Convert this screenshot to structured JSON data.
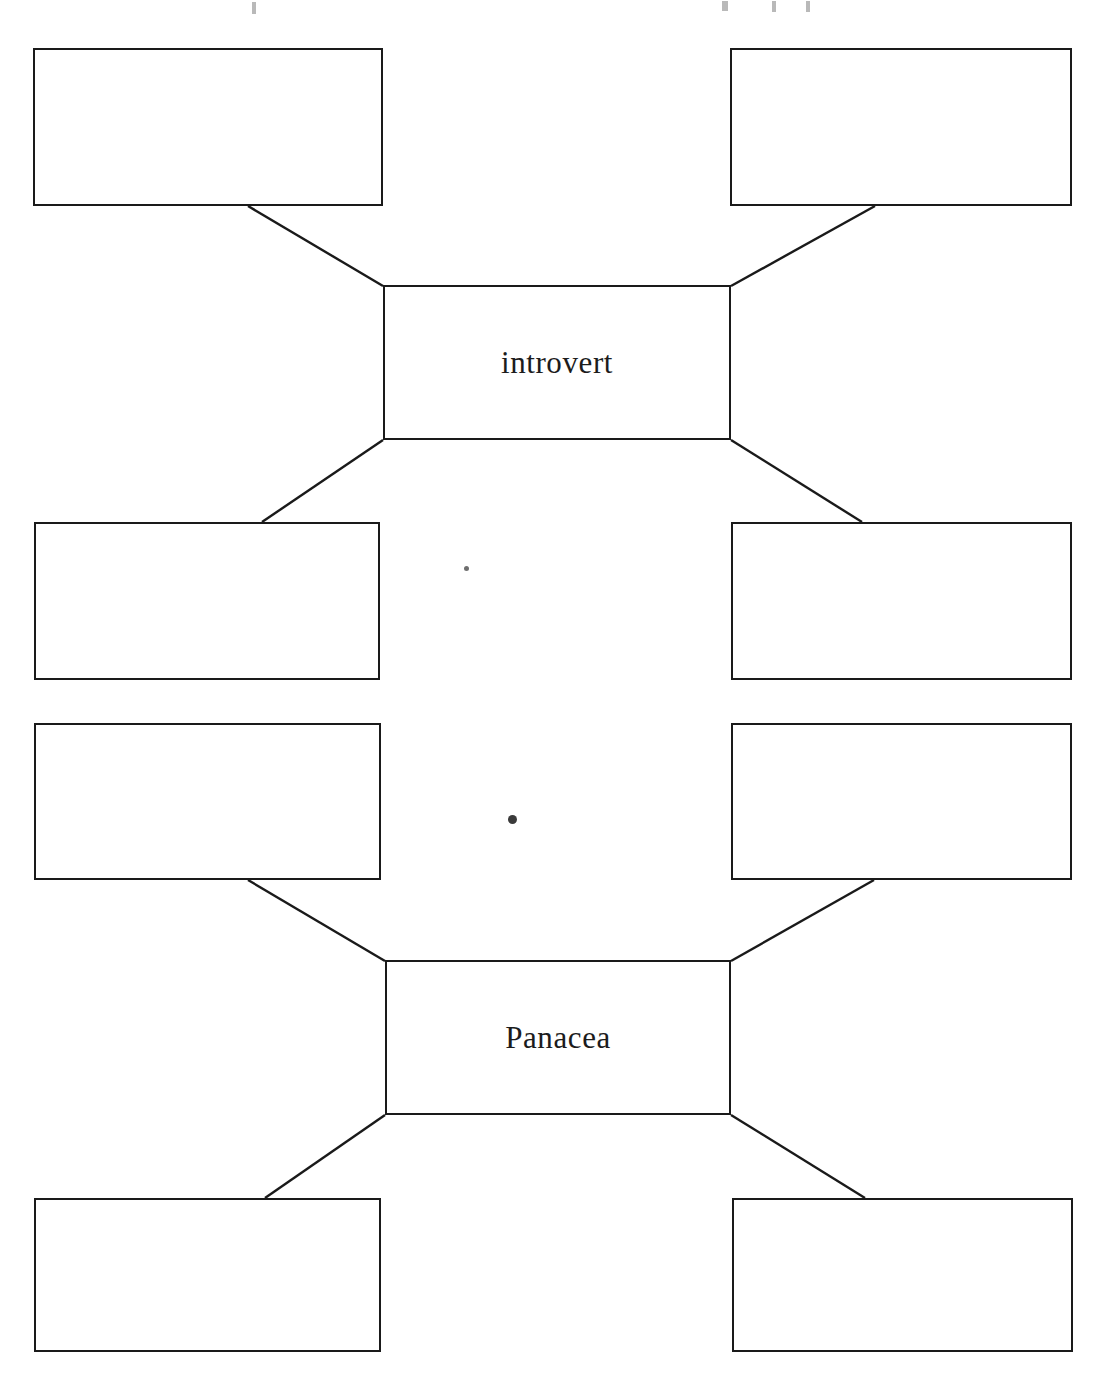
{
  "document": {
    "kind": "worksheet",
    "title": "",
    "background_color": "#ffffff",
    "ink_color": "#1a1a1a",
    "page_width": 1112,
    "page_height": 1379
  },
  "diagrams": [
    {
      "id": "word-web-introvert",
      "center": {
        "label": "introvert",
        "x": 383,
        "y": 285,
        "w": 348,
        "h": 155
      },
      "branches": [
        {
          "id": "introvert-branch-top-left",
          "label": "",
          "x": 33,
          "y": 48,
          "w": 350,
          "h": 158
        },
        {
          "id": "introvert-branch-top-right",
          "label": "",
          "x": 730,
          "y": 48,
          "w": 342,
          "h": 158
        },
        {
          "id": "introvert-branch-bottom-left",
          "label": "",
          "x": 34,
          "y": 522,
          "w": 346,
          "h": 158
        },
        {
          "id": "introvert-branch-bottom-right",
          "label": "",
          "x": 731,
          "y": 522,
          "w": 341,
          "h": 158
        }
      ],
      "connectors": [
        {
          "from": "introvert-branch-top-left",
          "x1": 248,
          "y1": 206,
          "x2": 383,
          "y2": 286
        },
        {
          "from": "introvert-branch-top-right",
          "x1": 875,
          "y1": 206,
          "x2": 731,
          "y2": 286
        },
        {
          "from": "introvert-branch-bottom-left",
          "x1": 262,
          "y1": 522,
          "x2": 383,
          "y2": 440
        },
        {
          "from": "introvert-branch-bottom-right",
          "x1": 862,
          "y1": 522,
          "x2": 731,
          "y2": 440
        }
      ]
    },
    {
      "id": "word-web-panacea",
      "center": {
        "label": "Panacea",
        "x": 385,
        "y": 960,
        "w": 346,
        "h": 155
      },
      "branches": [
        {
          "id": "panacea-branch-top-left",
          "label": "",
          "x": 34,
          "y": 723,
          "w": 347,
          "h": 157
        },
        {
          "id": "panacea-branch-top-right",
          "label": "",
          "x": 731,
          "y": 723,
          "w": 341,
          "h": 157
        },
        {
          "id": "panacea-branch-bottom-left",
          "label": "",
          "x": 34,
          "y": 1198,
          "w": 347,
          "h": 154
        },
        {
          "id": "panacea-branch-bottom-right",
          "label": "",
          "x": 732,
          "y": 1198,
          "w": 341,
          "h": 154
        }
      ],
      "connectors": [
        {
          "from": "panacea-branch-top-left",
          "x1": 248,
          "y1": 880,
          "x2": 385,
          "y2": 961
        },
        {
          "from": "panacea-branch-top-right",
          "x1": 874,
          "y1": 880,
          "x2": 731,
          "y2": 961
        },
        {
          "from": "panacea-branch-bottom-left",
          "x1": 265,
          "y1": 1198,
          "x2": 385,
          "y2": 1115
        },
        {
          "from": "panacea-branch-bottom-right",
          "x1": 865,
          "y1": 1198,
          "x2": 731,
          "y2": 1115
        }
      ]
    }
  ],
  "scan_artifacts": [
    {
      "id": "speck-upper",
      "x": 464,
      "y": 566,
      "size": 5,
      "shade": "light"
    },
    {
      "id": "speck-lower",
      "x": 508,
      "y": 815,
      "size": 9,
      "shade": "dark"
    },
    {
      "id": "edge-mark-left",
      "x": 252,
      "y": 2,
      "w": 4,
      "h": 12
    },
    {
      "id": "edge-mark-center",
      "x": 722,
      "y": 1,
      "w": 6,
      "h": 10
    },
    {
      "id": "edge-mark-right1",
      "x": 772,
      "y": 1,
      "w": 4,
      "h": 11
    },
    {
      "id": "edge-mark-right2",
      "x": 806,
      "y": 1,
      "w": 4,
      "h": 11
    }
  ]
}
